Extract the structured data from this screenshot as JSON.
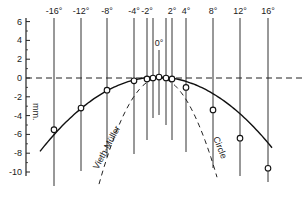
{
  "figure": {
    "y_axis": {
      "unit_label": "mm.",
      "ticks": [
        {
          "value": 6,
          "label": "6"
        },
        {
          "value": 4,
          "label": "4"
        },
        {
          "value": 2,
          "label": "2"
        },
        {
          "value": 0,
          "label": "0"
        },
        {
          "value": -2,
          "label": "-2"
        },
        {
          "value": -4,
          "label": "-4"
        },
        {
          "value": -6,
          "label": "-6"
        },
        {
          "value": -8,
          "label": "-8"
        },
        {
          "value": -10,
          "label": "-10"
        }
      ]
    },
    "angle_lines": [
      {
        "label": "-16°",
        "x": 54,
        "top": 18,
        "bottom": 186,
        "labeled": true
      },
      {
        "label": "-12°",
        "x": 81,
        "top": 18,
        "bottom": 171,
        "labeled": true
      },
      {
        "label": "-8°",
        "x": 107,
        "top": 18,
        "bottom": 157,
        "labeled": true
      },
      {
        "label": "-4°",
        "x": 134,
        "top": 18,
        "bottom": 154,
        "labeled": true
      },
      {
        "label": "-2°",
        "x": 147,
        "top": 18,
        "bottom": 140,
        "labeled": true
      },
      {
        "label": "",
        "x": 153,
        "top": 18,
        "bottom": 118,
        "labeled": false
      },
      {
        "label": "0°",
        "x": 159,
        "top": 50,
        "bottom": 115,
        "labeled": true
      },
      {
        "label": "",
        "x": 166,
        "top": 18,
        "bottom": 125,
        "labeled": false
      },
      {
        "label": "2°",
        "x": 172,
        "top": 18,
        "bottom": 140,
        "labeled": true
      },
      {
        "label": "4°",
        "x": 186,
        "top": 18,
        "bottom": 152,
        "labeled": true
      },
      {
        "label": "8°",
        "x": 213,
        "top": 18,
        "bottom": 168,
        "labeled": true
      },
      {
        "label": "12°",
        "x": 240,
        "top": 18,
        "bottom": 176,
        "labeled": true
      },
      {
        "label": "16°",
        "x": 268,
        "top": 18,
        "bottom": 182,
        "labeled": true
      }
    ],
    "curves": {
      "vieth_muller_label": "Vieth-Müller",
      "circle_label": "Circle"
    }
  },
  "chart_data": {
    "type": "line",
    "title": "",
    "xlabel": "Eccentricity (degrees)",
    "ylabel": "mm.",
    "ylim": [
      -10,
      6
    ],
    "y_ticks": [
      6,
      4,
      2,
      0,
      -2,
      -4,
      -6,
      -8,
      -10
    ],
    "x_labels": [
      "-16°",
      "-12°",
      "-8°",
      "-4°",
      "-2°",
      "0°",
      "2°",
      "4°",
      "8°",
      "12°",
      "16°"
    ],
    "series": [
      {
        "name": "Empirical horopter (measured)",
        "style": "solid with open circles",
        "x": [
          -16,
          -12,
          -8,
          -4,
          -2,
          -1,
          0,
          1,
          2,
          4,
          8,
          12,
          16
        ],
        "values": [
          -5.5,
          -3.2,
          -1.3,
          -0.3,
          -0.1,
          0.0,
          0.1,
          0.0,
          -0.1,
          -1.0,
          -3.4,
          -6.4,
          -9.6
        ]
      },
      {
        "name": "Vieth-Müller Circle",
        "style": "dashed",
        "x": [
          -12,
          -8,
          -4,
          -2,
          0,
          2,
          4,
          8,
          12
        ],
        "values": [
          -20,
          -9.0,
          -2.2,
          -0.5,
          0.0,
          -0.5,
          -2.2,
          -9.0,
          -20
        ]
      },
      {
        "name": "Zero reference",
        "style": "dashed horizontal",
        "x": [
          -20,
          20
        ],
        "values": [
          0,
          0
        ]
      }
    ],
    "grid": false,
    "legend": "inline curve labels"
  }
}
